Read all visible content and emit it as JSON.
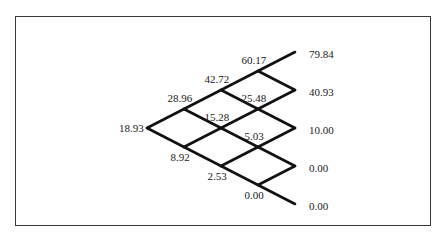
{
  "diagram": {
    "title": "",
    "type": "binomial-tree",
    "steps": 4,
    "origin": {
      "x": 147,
      "y": 128
    },
    "dx": 37,
    "dy": 19,
    "line_color": "#111111",
    "nodes": [
      {
        "id": "n0_0",
        "step": 0,
        "ups": 0,
        "value": "18.93",
        "label_pos": "left"
      },
      {
        "id": "n1_1",
        "step": 1,
        "ups": 1,
        "value": "28.96",
        "label_pos": "above"
      },
      {
        "id": "n1_0",
        "step": 1,
        "ups": 0,
        "value": "8.92",
        "label_pos": "below"
      },
      {
        "id": "n2_2",
        "step": 2,
        "ups": 2,
        "value": "42.72",
        "label_pos": "above"
      },
      {
        "id": "n2_1",
        "step": 2,
        "ups": 1,
        "value": "15.28",
        "label_pos": "above"
      },
      {
        "id": "n2_0",
        "step": 2,
        "ups": 0,
        "value": "2.53",
        "label_pos": "below"
      },
      {
        "id": "n3_3",
        "step": 3,
        "ups": 3,
        "value": "60.17",
        "label_pos": "above"
      },
      {
        "id": "n3_2",
        "step": 3,
        "ups": 2,
        "value": "25.48",
        "label_pos": "above"
      },
      {
        "id": "n3_1",
        "step": 3,
        "ups": 1,
        "value": "5.03",
        "label_pos": "above"
      },
      {
        "id": "n3_0",
        "step": 3,
        "ups": 0,
        "value": "0.00",
        "label_pos": "below"
      },
      {
        "id": "n4_4",
        "step": 4,
        "ups": 4,
        "value": "79.84",
        "label_pos": "right"
      },
      {
        "id": "n4_3",
        "step": 4,
        "ups": 3,
        "value": "40.93",
        "label_pos": "right"
      },
      {
        "id": "n4_2",
        "step": 4,
        "ups": 2,
        "value": "10.00",
        "label_pos": "right"
      },
      {
        "id": "n4_1",
        "step": 4,
        "ups": 1,
        "value": "0.00",
        "label_pos": "right"
      },
      {
        "id": "n4_0",
        "step": 4,
        "ups": 0,
        "value": "0.00",
        "label_pos": "right"
      }
    ]
  }
}
